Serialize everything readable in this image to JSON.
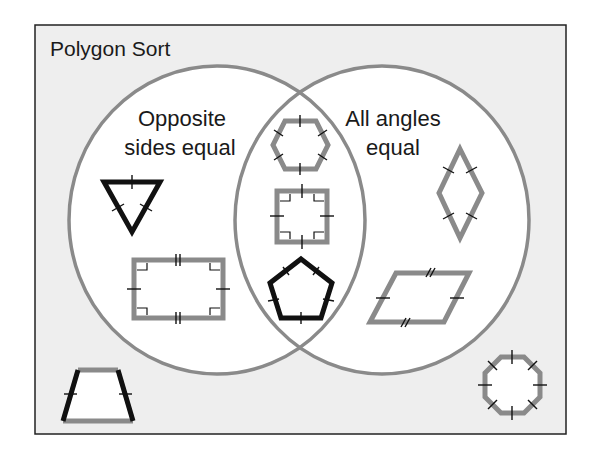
{
  "diagram": {
    "title": "Polygon Sort",
    "type": "venn",
    "colors": {
      "frame_background": "#eeeeee",
      "frame_border": "#222222",
      "circle_fill": "#ffffff",
      "circle_stroke": "#8a8a8a",
      "shape_gray": "#8a8a8a",
      "shape_black": "#111111"
    },
    "sets": [
      {
        "id": "left",
        "label_line1": "Opposite",
        "label_line2": "sides equal"
      },
      {
        "id": "right",
        "label_line1": "All angles",
        "label_line2": "equal"
      }
    ],
    "shapes": [
      {
        "name": "equilateral-triangle",
        "region": "left-only",
        "stroke": "black"
      },
      {
        "name": "rectangle",
        "region": "left-only",
        "stroke": "gray"
      },
      {
        "name": "regular-hexagon",
        "region": "intersection",
        "stroke": "gray"
      },
      {
        "name": "square",
        "region": "intersection",
        "stroke": "gray"
      },
      {
        "name": "regular-pentagon",
        "region": "intersection",
        "stroke": "black"
      },
      {
        "name": "rhombus",
        "region": "right-only",
        "stroke": "gray"
      },
      {
        "name": "parallelogram",
        "region": "right-only",
        "stroke": "gray"
      },
      {
        "name": "isosceles-trapezoid",
        "region": "outside",
        "stroke": "black-legs-gray-bases"
      },
      {
        "name": "regular-octagon",
        "region": "outside",
        "stroke": "gray"
      }
    ]
  }
}
